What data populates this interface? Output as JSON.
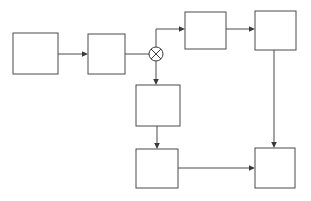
{
  "diagram": {
    "type": "block-flow-diagram",
    "canvas": {
      "width": 311,
      "height": 201,
      "background": "#ffffff"
    },
    "style": {
      "line_color": "#4a4a4a",
      "node_fill": "#ffffff",
      "node_stroke": "#4a4a4a",
      "junction_color": "#3a3a3a",
      "stroke_width": 1
    },
    "nodes": [
      {
        "id": "box-1",
        "label": "",
        "shape": "rectangle",
        "x": 13,
        "y": 33,
        "width": 45,
        "height": 41
      },
      {
        "id": "box-2",
        "label": "",
        "shape": "rectangle",
        "x": 88,
        "y": 34,
        "width": 37,
        "height": 40
      },
      {
        "id": "box-3",
        "label": "",
        "shape": "rectangle",
        "x": 185,
        "y": 12,
        "width": 41,
        "height": 37
      },
      {
        "id": "box-4",
        "label": "",
        "shape": "rectangle",
        "x": 255,
        "y": 11,
        "width": 41,
        "height": 39
      },
      {
        "id": "box-5",
        "label": "",
        "shape": "rectangle",
        "x": 136,
        "y": 85,
        "width": 44,
        "height": 41
      },
      {
        "id": "box-6",
        "label": "",
        "shape": "rectangle",
        "x": 136,
        "y": 149,
        "width": 42,
        "height": 39
      },
      {
        "id": "box-7",
        "label": "",
        "shape": "rectangle",
        "x": 255,
        "y": 148,
        "width": 40,
        "height": 40
      }
    ],
    "junctions": [
      {
        "id": "junction-1",
        "label": "",
        "symbol": "circle-with-cross",
        "glyph": "⊗",
        "cx": 156,
        "cy": 54,
        "r": 7
      }
    ],
    "edges": [
      {
        "id": "edge-box1-box2",
        "from": "box-1",
        "to": "box-2",
        "arrow": true,
        "routing": "horizontal"
      },
      {
        "id": "edge-box2-junction1",
        "from": "box-2",
        "to": "junction-1",
        "arrow": false,
        "routing": "horizontal"
      },
      {
        "id": "edge-junction1-box3",
        "from": "junction-1",
        "to": "box-3",
        "arrow": true,
        "routing": "up-then-right"
      },
      {
        "id": "edge-box3-box4",
        "from": "box-3",
        "to": "box-4",
        "arrow": true,
        "routing": "horizontal"
      },
      {
        "id": "edge-junction1-box5",
        "from": "junction-1",
        "to": "box-5",
        "arrow": true,
        "routing": "vertical-down"
      },
      {
        "id": "edge-box5-box6",
        "from": "box-5",
        "to": "box-6",
        "arrow": true,
        "routing": "vertical-down"
      },
      {
        "id": "edge-box6-box7",
        "from": "box-6",
        "to": "box-7",
        "arrow": true,
        "routing": "horizontal"
      },
      {
        "id": "edge-box4-box7",
        "from": "box-4",
        "to": "box-7",
        "arrow": true,
        "routing": "vertical-down"
      }
    ]
  }
}
